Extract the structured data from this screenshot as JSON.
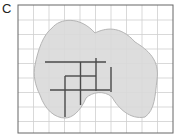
{
  "panel": {
    "label": "C"
  },
  "colors": {
    "grid": "#cfcfcf",
    "frame": "#555555",
    "shape_fill": "#d9d9d9",
    "shape_stroke": "#b5b5b5",
    "lines": "#4a4a4a"
  },
  "grid": {
    "x0": 18,
    "y0": 5,
    "x1": 173,
    "y1": 133,
    "spacing": 15.3
  }
}
